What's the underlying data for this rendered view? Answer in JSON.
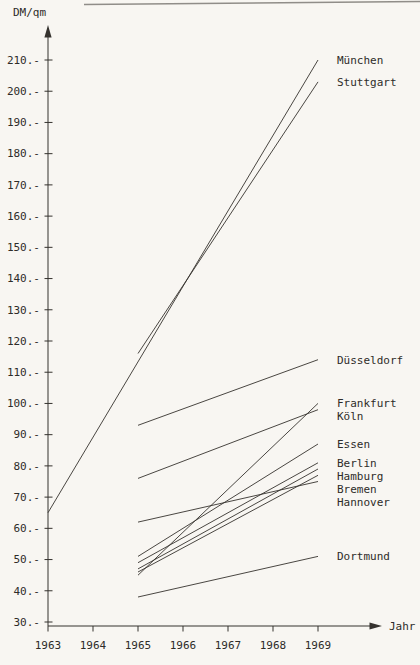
{
  "colors": {
    "paper": "#f8f6f2",
    "ink": "#35322e",
    "scan_edge": "#6e6b66"
  },
  "chart_data": {
    "type": "line",
    "title": "",
    "ylabel": "DM/qm",
    "xlabel": "Jahr",
    "grid": false,
    "legend_position": "right-of-line-ends",
    "xlim": [
      1963,
      1969
    ],
    "ylim": [
      30,
      210
    ],
    "x_ticks": [
      1963,
      1964,
      1965,
      1966,
      1967,
      1968,
      1969
    ],
    "y_ticks": [
      {
        "value": 210,
        "label": "210.-"
      },
      {
        "value": 200,
        "label": "200.-"
      },
      {
        "value": 190,
        "label": "190.-"
      },
      {
        "value": 180,
        "label": "180.-"
      },
      {
        "value": 170,
        "label": "170.-"
      },
      {
        "value": 160,
        "label": "160.-"
      },
      {
        "value": 150,
        "label": "150.-"
      },
      {
        "value": 140,
        "label": "140.-"
      },
      {
        "value": 130,
        "label": "130.-"
      },
      {
        "value": 120,
        "label": "120.-"
      },
      {
        "value": 110,
        "label": "110.-"
      },
      {
        "value": 100,
        "label": "100.-"
      },
      {
        "value": 90,
        "label": "90.-"
      },
      {
        "value": 80,
        "label": "80.-"
      },
      {
        "value": 70,
        "label": "70.-"
      },
      {
        "value": 60,
        "label": "60.-"
      },
      {
        "value": 50,
        "label": "50.-"
      },
      {
        "value": 40,
        "label": "40.-"
      },
      {
        "value": 30,
        "label": "30.-"
      }
    ],
    "series": [
      {
        "name": "München",
        "points": [
          [
            1963,
            65
          ],
          [
            1969,
            210
          ]
        ]
      },
      {
        "name": "Stuttgart",
        "points": [
          [
            1965,
            116
          ],
          [
            1969,
            203
          ]
        ]
      },
      {
        "name": "Düsseldorf",
        "points": [
          [
            1965,
            93
          ],
          [
            1969,
            114
          ]
        ]
      },
      {
        "name": "Frankfurt",
        "points": [
          [
            1965,
            45
          ],
          [
            1969,
            100
          ]
        ]
      },
      {
        "name": "Köln",
        "points": [
          [
            1965,
            76
          ],
          [
            1969,
            98
          ]
        ]
      },
      {
        "name": "Essen",
        "points": [
          [
            1965,
            51
          ],
          [
            1969,
            87
          ]
        ]
      },
      {
        "name": "Berlin",
        "points": [
          [
            1965,
            49
          ],
          [
            1969,
            81
          ]
        ]
      },
      {
        "name": "Hamburg",
        "points": [
          [
            1965,
            47
          ],
          [
            1969,
            79
          ]
        ]
      },
      {
        "name": "Bremen",
        "points": [
          [
            1965,
            46
          ],
          [
            1969,
            77
          ]
        ]
      },
      {
        "name": "Hannover",
        "points": [
          [
            1965,
            62
          ],
          [
            1969,
            75
          ]
        ]
      },
      {
        "name": "Dortmund",
        "points": [
          [
            1965,
            38
          ],
          [
            1969,
            51
          ]
        ]
      }
    ]
  }
}
